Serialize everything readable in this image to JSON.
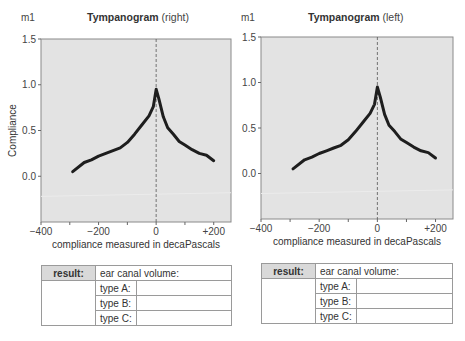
{
  "charts": [
    {
      "unit": "m1",
      "title_bold": "Tympanogram",
      "title_side": "(right)",
      "ylabel": "Compliance",
      "xlabel": "compliance measured in decaPascals",
      "table": {
        "result_label": "result:",
        "ear_canal_label": "ear canal volume:",
        "rows": [
          {
            "label": "type A:",
            "value": ""
          },
          {
            "label": "type B:",
            "value": ""
          },
          {
            "label": "type C:",
            "value": ""
          }
        ]
      }
    },
    {
      "unit": "m1",
      "title_bold": "Tympanogram",
      "title_side": "(left)",
      "ylabel": "",
      "xlabel": "compliance measured in decaPascals",
      "table": {
        "result_label": "result:",
        "ear_canal_label": "ear canal volume:",
        "rows": [
          {
            "label": "type A:",
            "value": ""
          },
          {
            "label": "type B:",
            "value": ""
          },
          {
            "label": "type C:",
            "value": ""
          }
        ]
      }
    }
  ],
  "chart_data": [
    {
      "type": "line",
      "title": "Tympanogram (right)",
      "unit_label": "m1",
      "xlabel": "compliance measured in decaPascals",
      "ylabel": "Compliance",
      "xlim": [
        -400,
        260
      ],
      "ylim": [
        -0.5,
        1.5
      ],
      "x_ticks": [
        "-400",
        "-200",
        "0",
        "+200"
      ],
      "y_ticks": [
        "0.0",
        "0.5",
        "1.0",
        "1.5"
      ],
      "reference_line": {
        "x": 0,
        "style": "dashed"
      },
      "grid": false,
      "series": [
        {
          "name": "compliance",
          "x": [
            -290,
            -250,
            -225,
            -200,
            -175,
            -150,
            -125,
            -100,
            -75,
            -50,
            -25,
            -10,
            0,
            10,
            25,
            40,
            60,
            80,
            100,
            125,
            150,
            175,
            200
          ],
          "values": [
            0.05,
            0.15,
            0.18,
            0.22,
            0.25,
            0.28,
            0.31,
            0.37,
            0.46,
            0.56,
            0.66,
            0.76,
            0.95,
            0.84,
            0.65,
            0.53,
            0.46,
            0.38,
            0.34,
            0.29,
            0.25,
            0.23,
            0.17
          ]
        }
      ]
    },
    {
      "type": "line",
      "title": "Tympanogram (left)",
      "unit_label": "m1",
      "xlabel": "compliance measured in decaPascals",
      "ylabel": "",
      "xlim": [
        -400,
        260
      ],
      "ylim": [
        -0.5,
        1.5
      ],
      "x_ticks": [
        "-400",
        "-200",
        "0",
        "+200"
      ],
      "y_ticks": [
        "0.0",
        "0.5",
        "1.0",
        "1.5"
      ],
      "reference_line": {
        "x": 0,
        "style": "dashed"
      },
      "grid": false,
      "series": [
        {
          "name": "compliance",
          "x": [
            -290,
            -250,
            -225,
            -200,
            -175,
            -150,
            -125,
            -100,
            -75,
            -50,
            -25,
            -10,
            0,
            10,
            25,
            40,
            60,
            80,
            100,
            125,
            150,
            175,
            200
          ],
          "values": [
            0.05,
            0.15,
            0.18,
            0.22,
            0.25,
            0.28,
            0.31,
            0.37,
            0.46,
            0.56,
            0.66,
            0.76,
            0.95,
            0.84,
            0.65,
            0.53,
            0.46,
            0.38,
            0.34,
            0.29,
            0.25,
            0.23,
            0.17
          ]
        }
      ]
    }
  ]
}
